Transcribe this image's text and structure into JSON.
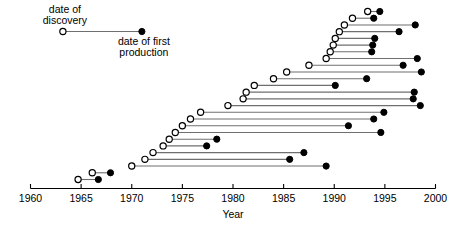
{
  "chart_data": {
    "type": "scatter",
    "subtype": "dumbbell-range",
    "title": "",
    "xlabel": "Year",
    "ylabel": "",
    "xlim": [
      1960,
      2000
    ],
    "xticks": [
      1960,
      1965,
      1970,
      1975,
      1980,
      1985,
      1990,
      1995,
      2000
    ],
    "xticklabels": [
      "1960",
      "1965",
      "1970",
      "1975",
      "1980",
      "1985",
      "1990",
      "1995",
      "2000"
    ],
    "grid": false,
    "legend_position": "inside-top-left",
    "series": [
      {
        "name": "date of discovery",
        "marker": "open-circle",
        "color": "#ffffff",
        "edge": "#000000"
      },
      {
        "name": "date of first production",
        "marker": "filled-circle",
        "color": "#000000",
        "edge": "#000000"
      }
    ],
    "annotations": [
      {
        "text": "date of discovery",
        "x": 1963.2,
        "y_row": 0
      },
      {
        "text": "date of first production",
        "x": 1971.0,
        "y_row": 0
      }
    ],
    "connector_color": "#6f6f6f",
    "rows": [
      {
        "index": 0,
        "discovery": 1993.3,
        "production": 1994.5
      },
      {
        "index": 1,
        "discovery": 1991.8,
        "production": 1993.9
      },
      {
        "index": 2,
        "discovery": 1991.0,
        "production": 1998.0
      },
      {
        "index": 3,
        "discovery": 1990.5,
        "production": 1996.4
      },
      {
        "index": 4,
        "discovery": 1990.1,
        "production": 1994.0
      },
      {
        "index": 5,
        "discovery": 1989.9,
        "production": 1993.8
      },
      {
        "index": 6,
        "discovery": 1989.6,
        "production": 1993.7
      },
      {
        "index": 7,
        "discovery": 1989.2,
        "production": 1998.2
      },
      {
        "index": 8,
        "discovery": 1987.5,
        "production": 1996.8
      },
      {
        "index": 9,
        "discovery": 1985.3,
        "production": 1998.6
      },
      {
        "index": 10,
        "discovery": 1984.0,
        "production": 1993.2
      },
      {
        "index": 11,
        "discovery": 1982.1,
        "production": 1990.1
      },
      {
        "index": 12,
        "discovery": 1981.3,
        "production": 1997.9
      },
      {
        "index": 13,
        "discovery": 1981.0,
        "production": 1997.8
      },
      {
        "index": 14,
        "discovery": 1979.5,
        "production": 1998.5
      },
      {
        "index": 15,
        "discovery": 1976.8,
        "production": 1994.9
      },
      {
        "index": 16,
        "discovery": 1975.8,
        "production": 1993.9
      },
      {
        "index": 17,
        "discovery": 1975.0,
        "production": 1991.4
      },
      {
        "index": 18,
        "discovery": 1974.3,
        "production": 1994.6
      },
      {
        "index": 19,
        "discovery": 1973.7,
        "production": 1978.4
      },
      {
        "index": 20,
        "discovery": 1973.1,
        "production": 1977.4
      },
      {
        "index": 21,
        "discovery": 1972.1,
        "production": 1987.0
      },
      {
        "index": 22,
        "discovery": 1971.3,
        "production": 1985.6
      },
      {
        "index": 23,
        "discovery": 1970.0,
        "production": 1989.2
      },
      {
        "index": 24,
        "discovery": 1966.1,
        "production": 1967.9
      },
      {
        "index": 25,
        "discovery": 1964.7,
        "production": 1966.7
      }
    ]
  }
}
